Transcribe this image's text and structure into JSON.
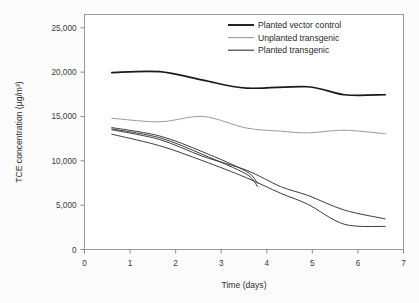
{
  "chart_data": {
    "type": "line",
    "title": "",
    "xlabel": "Time (days)",
    "ylabel": "TCE concentration (µg/m³)",
    "xlim": [
      0,
      7
    ],
    "ylim": [
      0,
      26500
    ],
    "xticks": [
      0,
      1,
      2,
      3,
      4,
      5,
      6,
      7
    ],
    "xticklabels": [
      "0",
      "1",
      "2",
      "3",
      "4",
      "5",
      "6",
      "7"
    ],
    "yticks": [
      0,
      5000,
      10000,
      15000,
      20000,
      25000
    ],
    "yticklabels": [
      "0",
      "5,000",
      "10,000",
      "15,000",
      "20,000",
      "25,000"
    ],
    "grid": false,
    "legend_position": "top-right-inside",
    "legend": [
      {
        "label": "Planted vector control",
        "color": "#1a1a1a",
        "style": "thick-solid"
      },
      {
        "label": "Unplanted transgenic",
        "color": "#9b9b9b",
        "style": "thin-solid"
      },
      {
        "label": "Planted transgenic",
        "color": "#333333",
        "style": "thin-solid"
      }
    ],
    "series": [
      {
        "name": "Planted vector control",
        "group": "Planted vector control",
        "color": "#1a1a1a",
        "x": [
          0.6,
          1.65,
          2.6,
          3.55,
          4.9,
          5.7,
          6.6
        ],
        "y": [
          19950,
          20050,
          19100,
          18200,
          18350,
          17450,
          17450
        ]
      },
      {
        "name": "Unplanted transgenic",
        "group": "Unplanted transgenic",
        "color": "#9b9b9b",
        "x": [
          0.6,
          1.65,
          2.6,
          3.55,
          4.3,
          4.9,
          5.7,
          6.6
        ],
        "y": [
          14800,
          14400,
          15000,
          13700,
          13350,
          13150,
          13450,
          13050
        ]
      },
      {
        "name": "Planted transgenic rep 1",
        "group": "Planted transgenic",
        "color": "#333333",
        "x": [
          0.6,
          1.65,
          2.6,
          3.55,
          3.8
        ],
        "y": [
          13750,
          12800,
          11000,
          8800,
          7450
        ]
      },
      {
        "name": "Planted transgenic rep 2",
        "group": "Planted transgenic",
        "color": "#333333",
        "x": [
          0.6,
          1.65,
          2.6,
          3.55,
          3.8
        ],
        "y": [
          13600,
          12600,
          10700,
          8500,
          7050
        ]
      },
      {
        "name": "Planted transgenic rep 3",
        "group": "Planted transgenic",
        "color": "#333333",
        "x": [
          0.6,
          1.65,
          2.6,
          3.55,
          4.3,
          4.9,
          5.7,
          6.6
        ],
        "y": [
          13500,
          12400,
          10500,
          8950,
          7100,
          6100,
          4450,
          3450
        ]
      },
      {
        "name": "Planted transgenic rep 4",
        "group": "Planted transgenic",
        "color": "#333333",
        "x": [
          0.6,
          1.65,
          2.6,
          3.55,
          4.3,
          4.9,
          5.7,
          6.6
        ],
        "y": [
          13000,
          11700,
          10000,
          8100,
          6350,
          5100,
          2850,
          2600
        ]
      }
    ]
  }
}
